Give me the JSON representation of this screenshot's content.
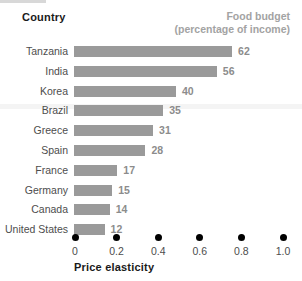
{
  "header": {
    "country_label": "Country",
    "budget_label_line1": "Food budget",
    "budget_label_line2": "(percentage of income)"
  },
  "axis": {
    "title": "Price elasticity",
    "ticks": [
      "0",
      "0.2",
      "0.4",
      "0.6",
      "0.8",
      "1.0"
    ]
  },
  "colors": {
    "bar": "#9a9a9a",
    "value_text": "#8c8c8c",
    "header_muted": "#a3a3a3",
    "axis_dot": "#000000",
    "text": "#4d4d4d",
    "background": "#ffffff"
  },
  "chart_data": {
    "type": "bar",
    "orientation": "horizontal",
    "title": "Food budget (percentage of income)",
    "xlabel": "Price elasticity",
    "ylabel": "Country",
    "xlim": [
      0,
      1.0
    ],
    "xticks": [
      0,
      0.2,
      0.4,
      0.6,
      0.8,
      1.0
    ],
    "grid": false,
    "legend": false,
    "value_suffix": "",
    "categories": [
      "Tanzania",
      "India",
      "Korea",
      "Brazil",
      "Greece",
      "Spain",
      "France",
      "Germany",
      "Canada",
      "United States"
    ],
    "values": [
      62,
      56,
      40,
      35,
      31,
      28,
      17,
      15,
      14,
      12
    ],
    "series": [
      {
        "name": "Food budget (percentage of income)",
        "values": [
          62,
          56,
          40,
          35,
          31,
          28,
          17,
          15,
          14,
          12
        ]
      }
    ],
    "rows": [
      {
        "country": "Tanzania",
        "value": 62,
        "label": "62"
      },
      {
        "country": "India",
        "value": 56,
        "label": "56"
      },
      {
        "country": "Korea",
        "value": 40,
        "label": "40"
      },
      {
        "country": "Brazil",
        "value": 35,
        "label": "35"
      },
      {
        "country": "Greece",
        "value": 31,
        "label": "31"
      },
      {
        "country": "Spain",
        "value": 28,
        "label": "28"
      },
      {
        "country": "France",
        "value": 17,
        "label": "17"
      },
      {
        "country": "Germany",
        "value": 15,
        "label": "15"
      },
      {
        "country": "Canada",
        "value": 14,
        "label": "14"
      },
      {
        "country": "United States",
        "value": 12,
        "label": "12"
      }
    ]
  }
}
